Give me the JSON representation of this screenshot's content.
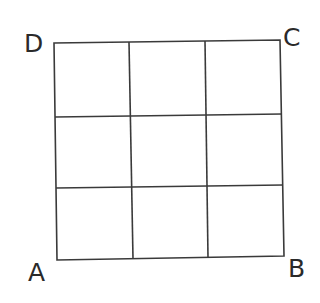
{
  "diagram": {
    "type": "3x3 square grid",
    "labels": {
      "top_left": "D",
      "top_right": "C",
      "bottom_right": "B",
      "bottom_left": "A"
    },
    "grid": {
      "rows": 3,
      "cols": 3
    },
    "colors": {
      "line": "#3a3a3a",
      "text": "#2a2a2a",
      "background": "#ffffff"
    }
  }
}
